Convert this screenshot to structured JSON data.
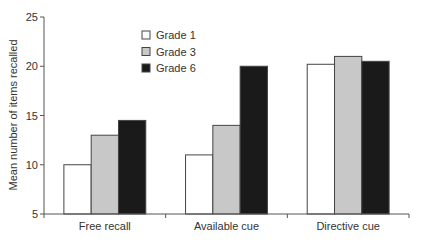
{
  "chart_data": {
    "type": "bar",
    "title": "",
    "xlabel": "",
    "ylabel": "Mean number of items recalled",
    "ylim": [
      5,
      25
    ],
    "yticks": [
      5,
      10,
      15,
      20,
      25
    ],
    "grid": false,
    "legend_position": "top-left-inside",
    "categories": [
      "Free recall",
      "Available cue",
      "Directive cue"
    ],
    "series": [
      {
        "name": "Grade 1",
        "color": "#ffffff",
        "values": [
          10,
          11,
          20.2
        ]
      },
      {
        "name": "Grade 3",
        "color": "#c8c8c8",
        "values": [
          13,
          14,
          21
        ]
      },
      {
        "name": "Grade 6",
        "color": "#1a1a1a",
        "values": [
          14.5,
          20,
          20.5
        ]
      }
    ]
  }
}
